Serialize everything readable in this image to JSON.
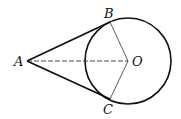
{
  "diagram": {
    "type": "geometry-tangent-lines",
    "points": {
      "A": {
        "label": "A",
        "x": 27,
        "y": 61
      },
      "B": {
        "label": "B",
        "x": 110,
        "y": 22
      },
      "C": {
        "label": "C",
        "x": 110,
        "y": 99
      },
      "O": {
        "label": "O",
        "x": 128,
        "y": 61
      }
    },
    "circle": {
      "center": "O",
      "radius": 43
    },
    "segments": [
      {
        "from": "A",
        "to": "B",
        "style": "solid-thick"
      },
      {
        "from": "A",
        "to": "C",
        "style": "solid-thick"
      },
      {
        "from": "O",
        "to": "B",
        "style": "solid-thin"
      },
      {
        "from": "O",
        "to": "C",
        "style": "solid-thin"
      },
      {
        "from": "A",
        "to": "O",
        "style": "dashed"
      }
    ],
    "colors": {
      "stroke": "#111111",
      "background": "#ffffff"
    }
  }
}
